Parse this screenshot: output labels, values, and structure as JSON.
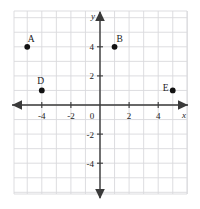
{
  "figure": {
    "kind": "coordinate-plane",
    "background_color": "#ffffff",
    "grid_color": "#d9d9dd",
    "axis_color": "#3a3a3a",
    "point_color": "#121212",
    "label_color": "#1a1a1a"
  },
  "axes": {
    "x_name": "x",
    "y_name": "y",
    "origin_label": "0",
    "x_ticks": [
      {
        "value": -4,
        "label": "-4"
      },
      {
        "value": -2,
        "label": "-2"
      },
      {
        "value": 2,
        "label": "2"
      },
      {
        "value": 4,
        "label": "4"
      }
    ],
    "y_ticks": [
      {
        "value": 4,
        "label": "4"
      },
      {
        "value": 2,
        "label": "2"
      },
      {
        "value": -2,
        "label": "-2"
      },
      {
        "value": -4,
        "label": "-4"
      }
    ]
  },
  "chart_data": {
    "type": "scatter",
    "title": "",
    "xlabel": "x",
    "ylabel": "y",
    "xlim": [
      -6,
      6
    ],
    "ylim": [
      -6,
      6
    ],
    "grid": true,
    "grid_step": 1,
    "legend": "none",
    "xticks": [
      -4,
      -2,
      2,
      4
    ],
    "yticks": [
      -4,
      -2,
      2,
      4
    ],
    "xticklabels": [
      "-4",
      "-2",
      "2",
      "4"
    ],
    "yticklabels": [
      "-4",
      "-2",
      "2",
      "4"
    ],
    "points": [
      {
        "label": "A",
        "x": -5,
        "y": 4,
        "label_dx": 4,
        "label_dy": -5
      },
      {
        "label": "B",
        "x": 1,
        "y": 4,
        "label_dx": 5,
        "label_dy": -5
      },
      {
        "label": "D",
        "x": -4,
        "y": 1,
        "label_dx": -1,
        "label_dy": -6
      },
      {
        "label": "E",
        "x": 5,
        "y": 1,
        "label_dx": -7,
        "label_dy": 1
      }
    ]
  }
}
